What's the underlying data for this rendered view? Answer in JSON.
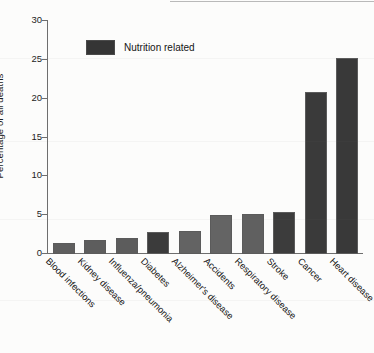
{
  "chart_data": {
    "type": "bar",
    "title": "",
    "xlabel": "",
    "ylabel": "Percentage of all deaths",
    "ylim": [
      0,
      30
    ],
    "yticks": [
      0,
      5,
      10,
      15,
      20,
      25,
      30
    ],
    "grid": false,
    "legend": {
      "position": "top-left",
      "entries": [
        {
          "label": "Nutrition related",
          "color": "#353535"
        }
      ]
    },
    "categories": [
      "Blood infections",
      "Kidney disease",
      "Influenza/pneumonia",
      "Diabetes",
      "Alzheimer's disease",
      "Accidents",
      "Respiratory disease",
      "Stroke",
      "Cancer",
      "Heart disease"
    ],
    "values": [
      1.4,
      1.8,
      2.1,
      2.8,
      3.0,
      5.0,
      5.1,
      5.4,
      20.9,
      25.2
    ],
    "nutrition_related": [
      false,
      false,
      false,
      true,
      false,
      false,
      false,
      true,
      true,
      true
    ],
    "colors": [
      "#5e5e5e",
      "#5d5d5d",
      "#5c5c5c",
      "#3b3b3b",
      "#636363",
      "#646464",
      "#606060",
      "#3c3c3c",
      "#3a3a3a",
      "#393939"
    ]
  }
}
